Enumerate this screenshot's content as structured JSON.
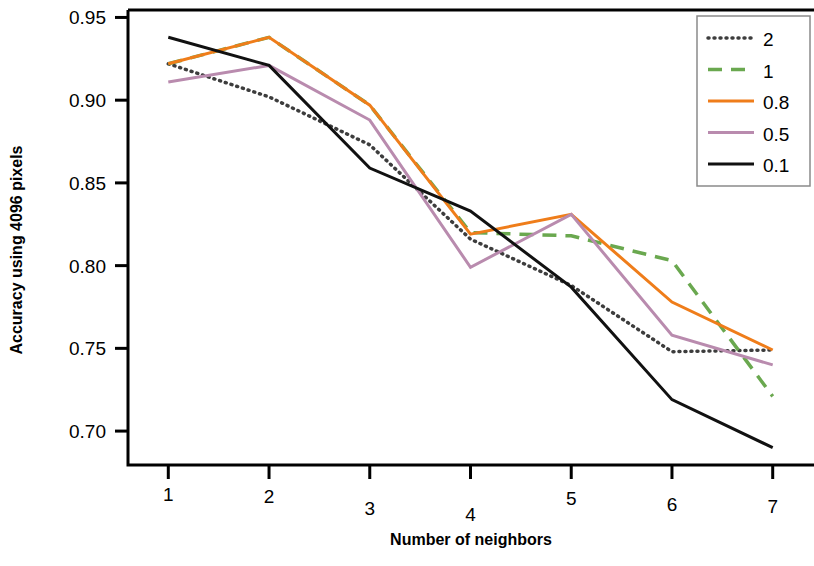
{
  "chart_data": {
    "type": "line",
    "title": "",
    "xlabel": "Number of neighbors",
    "ylabel": "Accuracy using 4096 pixels",
    "x": [
      1,
      2,
      3,
      4,
      5,
      6,
      7
    ],
    "xticklabels": [
      "1",
      "2",
      "3",
      "4",
      "5",
      "6",
      "7"
    ],
    "yticks": [
      0.7,
      0.75,
      0.8,
      0.85,
      0.9,
      0.95
    ],
    "yticklabels": [
      "0.70",
      "0.75",
      "0.80",
      "0.85",
      "0.90",
      "0.95"
    ],
    "xlim": [
      0.6,
      7.4
    ],
    "ylim": [
      0.6795,
      0.9545
    ],
    "grid": false,
    "legend_position": "top-right",
    "series": [
      {
        "name": "2",
        "values": [
          0.922,
          0.902,
          0.873,
          0.816,
          0.788,
          0.748,
          0.749
        ],
        "color": "#3d3d3d",
        "linestyle": "dotted",
        "legend_label": "2"
      },
      {
        "name": "1",
        "values": [
          0.922,
          0.938,
          0.897,
          0.82,
          0.818,
          0.803,
          0.721
        ],
        "color": "#6aa84f",
        "linestyle": "dashed",
        "legend_label": "1"
      },
      {
        "name": "0.8",
        "values": [
          0.922,
          0.938,
          0.897,
          0.819,
          0.831,
          0.778,
          0.749
        ],
        "color": "#ef7d1a",
        "linestyle": "solid",
        "legend_label": "0.8"
      },
      {
        "name": "0.5",
        "values": [
          0.911,
          0.921,
          0.888,
          0.799,
          0.831,
          0.758,
          0.74
        ],
        "color": "#b98bae",
        "linestyle": "solid",
        "legend_label": "0.5"
      },
      {
        "name": "0.1",
        "values": [
          0.938,
          0.921,
          0.859,
          0.833,
          0.787,
          0.719,
          0.69
        ],
        "color": "#111111",
        "linestyle": "solid",
        "legend_label": "0.1"
      }
    ]
  },
  "legend": {
    "entries": [
      "2",
      "1",
      "0.8",
      "0.5",
      "0.1"
    ]
  }
}
